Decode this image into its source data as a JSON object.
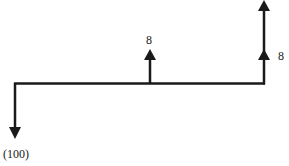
{
  "diagram": {
    "type": "cash-flow-timeline",
    "line_color": "#1a1a1a",
    "flows": [
      {
        "position": 0,
        "direction": "down",
        "label": "(100)"
      },
      {
        "position": 1,
        "direction": "up",
        "label": "8"
      },
      {
        "position": 2,
        "direction": "up",
        "label": "8"
      },
      {
        "position": 2,
        "direction": "up",
        "label": ""
      }
    ]
  }
}
